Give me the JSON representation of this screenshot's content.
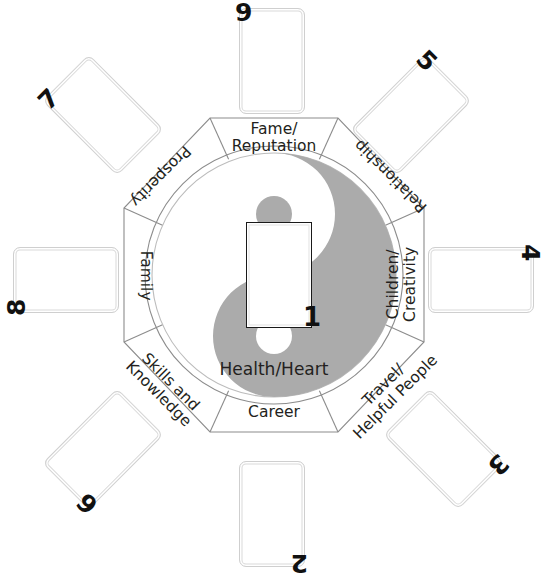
{
  "diagram": {
    "center": {
      "card_label": "1",
      "yin_yang": {
        "dark_color": "#ababab",
        "light_color": "#ffffff",
        "outline_color": "#b5b5b5"
      },
      "health_label": "Health/Heart"
    },
    "sectors": [
      {
        "id": "fame",
        "label": "Fame/\nReputation",
        "position": "top",
        "rotation": 0
      },
      {
        "id": "relationship",
        "label": "Relationship",
        "position": "top-right",
        "rotation": 225
      },
      {
        "id": "children",
        "label": "Children/\nCreativity",
        "position": "right",
        "rotation": 270
      },
      {
        "id": "travel",
        "label": "Travel/\nHelpful People",
        "position": "bottom-right",
        "rotation": 315
      },
      {
        "id": "career",
        "label": "Career",
        "position": "bottom",
        "rotation": 0
      },
      {
        "id": "skills",
        "label": "Skills and\nKnowledge",
        "position": "bottom-left",
        "rotation": 45
      },
      {
        "id": "family",
        "label": "Family",
        "position": "left",
        "rotation": 90
      },
      {
        "id": "prosperity",
        "label": "Prosperity",
        "position": "top-left",
        "rotation": 135
      }
    ],
    "cards": [
      {
        "number": "9",
        "position": "top",
        "rotation": 0,
        "num_corner": "top-left"
      },
      {
        "number": "5",
        "position": "top-right",
        "rotation": 45,
        "num_corner": "top-left"
      },
      {
        "number": "4",
        "position": "right",
        "rotation": 90,
        "num_corner": "top-left"
      },
      {
        "number": "3",
        "position": "bottom-right",
        "rotation": 135,
        "num_corner": "top-left"
      },
      {
        "number": "2",
        "position": "bottom",
        "rotation": 180,
        "num_corner": "top-left"
      },
      {
        "number": "6",
        "position": "bottom-left",
        "rotation": 225,
        "num_corner": "top-left"
      },
      {
        "number": "8",
        "position": "left",
        "rotation": 270,
        "num_corner": "top-left"
      },
      {
        "number": "7",
        "position": "top-left",
        "rotation": 315,
        "num_corner": "top-left"
      }
    ]
  }
}
